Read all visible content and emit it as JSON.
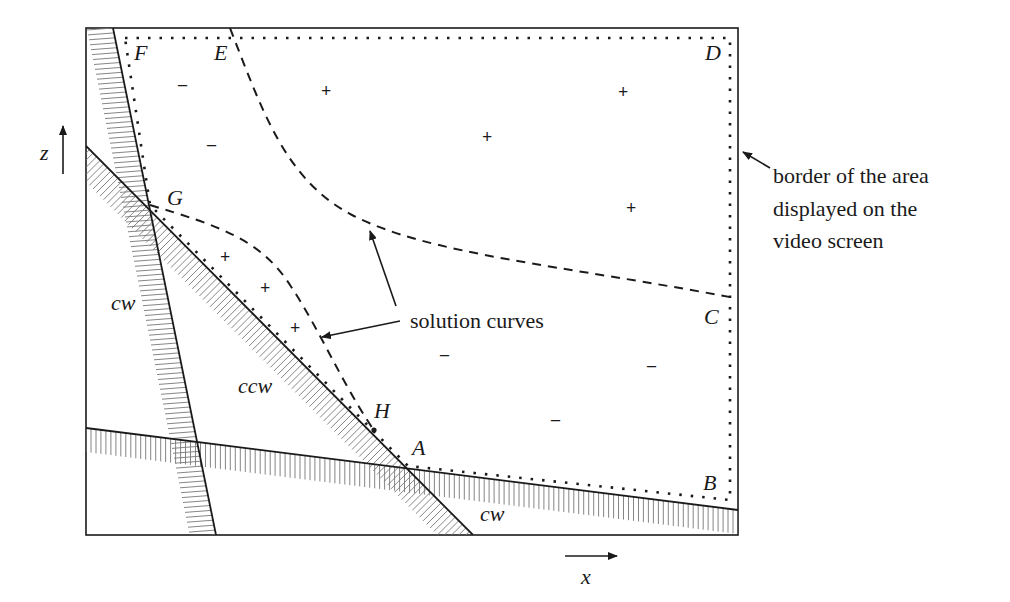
{
  "diagram": {
    "title": "",
    "axes": {
      "x_label": "x",
      "z_label": "z"
    },
    "points": {
      "A": "A",
      "B": "B",
      "C": "C",
      "D": "D",
      "E": "E",
      "F": "F",
      "G": "G",
      "H": "H"
    },
    "regions": {
      "cw_left": "cw",
      "ccw_middle": "ccw",
      "cw_bottom": "cw"
    },
    "signs": {
      "minus": "–",
      "plus": "+"
    },
    "annotations": {
      "solution_curves": "solution curves",
      "border_line1": "border of the area",
      "border_line2": "displayed on the",
      "border_line3": "video screen"
    },
    "colors": {
      "line": "#1a1a1a",
      "hatch": "#777777",
      "background": "#ffffff"
    }
  }
}
